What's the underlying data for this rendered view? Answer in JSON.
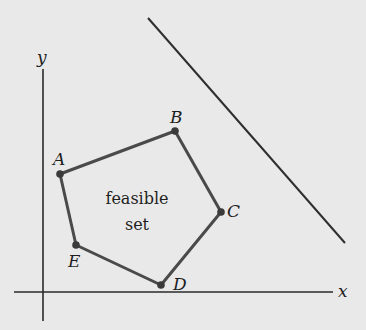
{
  "diagram": {
    "colors": {
      "background": "#e9e9e9",
      "axis": "#2a2a2a",
      "polygon_edge": "#4a4a4a",
      "vertex": "#3a3a3a",
      "constraint_line": "#2e2e2e",
      "text": "#1e1e1e"
    },
    "axes": {
      "x_label": "x",
      "y_label": "y",
      "x_axis": {
        "x1": 14,
        "y1": 292,
        "x2": 333,
        "y2": 292
      },
      "y_axis": {
        "x1": 43,
        "y1": 69,
        "x2": 43,
        "y2": 321
      }
    },
    "region_label": {
      "line1": "feasible",
      "line2": "set"
    },
    "vertices": [
      {
        "name": "A",
        "x": 60,
        "y": 174
      },
      {
        "name": "B",
        "x": 175,
        "y": 131
      },
      {
        "name": "C",
        "x": 221,
        "y": 212
      },
      {
        "name": "D",
        "x": 161,
        "y": 285
      },
      {
        "name": "E",
        "x": 76,
        "y": 245
      }
    ],
    "constraint_line": {
      "x1": 148,
      "y1": 18,
      "x2": 345,
      "y2": 243
    }
  }
}
